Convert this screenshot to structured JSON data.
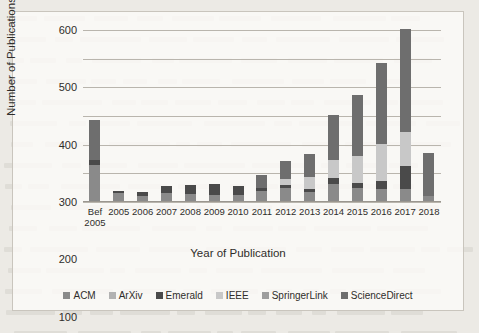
{
  "chart_data": {
    "type": "bar",
    "stacked": true,
    "title": "",
    "xlabel": "Year of Publication",
    "ylabel": "Number of Publications",
    "ylim": [
      0,
      600
    ],
    "yticks": [
      0,
      100,
      200,
      300,
      400,
      500,
      600
    ],
    "grid": true,
    "legend_position": "bottom",
    "categories": [
      "Bef 2005",
      "2005",
      "2006",
      "2007",
      "2008",
      "2009",
      "2010",
      "2011",
      "2012",
      "2013",
      "2014",
      "2015",
      "2016",
      "2017",
      "2018"
    ],
    "category_lines": [
      [
        "Bef",
        "2005"
      ],
      [
        "2005",
        ""
      ],
      [
        "2006",
        ""
      ],
      [
        "2007",
        ""
      ],
      [
        "2008",
        ""
      ],
      [
        "2009",
        ""
      ],
      [
        "2010",
        ""
      ],
      [
        "2011",
        ""
      ],
      [
        "2012",
        ""
      ],
      [
        "2013",
        ""
      ],
      [
        "2014",
        ""
      ],
      [
        "2015",
        ""
      ],
      [
        "2016",
        ""
      ],
      [
        "2017",
        ""
      ],
      [
        "2018",
        ""
      ]
    ],
    "series": [
      {
        "name": "ACM",
        "color": "#8a8a8a",
        "values": [
          130,
          30,
          22,
          30,
          28,
          26,
          25,
          38,
          48,
          36,
          62,
          48,
          45,
          45,
          22
        ]
      },
      {
        "name": "ArXiv",
        "color": "#b2b2b2",
        "values": [
          0,
          0,
          0,
          0,
          0,
          0,
          0,
          0,
          0,
          0,
          0,
          0,
          0,
          0,
          0
        ]
      },
      {
        "name": "Emerald",
        "color": "#4a4a4a",
        "values": [
          18,
          8,
          12,
          26,
          30,
          38,
          30,
          10,
          12,
          8,
          22,
          20,
          28,
          80,
          0
        ]
      },
      {
        "name": "IEEE",
        "color": "#c8c8c8",
        "values": [
          0,
          0,
          0,
          0,
          0,
          0,
          0,
          0,
          22,
          42,
          62,
          92,
          130,
          120,
          0
        ]
      },
      {
        "name": "SpringerLink",
        "color": "#9e9e9e",
        "values": [
          0,
          0,
          0,
          0,
          0,
          0,
          0,
          0,
          0,
          0,
          0,
          0,
          0,
          0,
          0
        ]
      },
      {
        "name": "ScienceDirect",
        "color": "#6e6e6e",
        "values": [
          138,
          0,
          0,
          0,
          0,
          0,
          0,
          48,
          62,
          80,
          158,
          212,
          282,
          360,
          148
        ]
      }
    ],
    "totals": [
      286,
      38,
      34,
      56,
      58,
      64,
      55,
      96,
      144,
      166,
      304,
      372,
      485,
      605,
      170
    ]
  },
  "figure": {
    "background_color": "#fcfbf9",
    "border_color": "#c9c5bd"
  }
}
